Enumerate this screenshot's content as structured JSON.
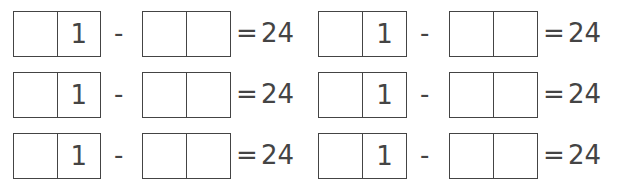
{
  "problems": [
    {
      "left_digits": [
        "",
        "1"
      ],
      "operator": "-",
      "right_digits": [
        "",
        ""
      ],
      "equals": "=",
      "result": "24"
    },
    {
      "left_digits": [
        "",
        "1"
      ],
      "operator": "-",
      "right_digits": [
        "",
        ""
      ],
      "equals": "=",
      "result": "24"
    },
    {
      "left_digits": [
        "",
        "1"
      ],
      "operator": "-",
      "right_digits": [
        "",
        ""
      ],
      "equals": "=",
      "result": "24"
    },
    {
      "left_digits": [
        "",
        "1"
      ],
      "operator": "-",
      "right_digits": [
        "",
        ""
      ],
      "equals": "=",
      "result": "24"
    },
    {
      "left_digits": [
        "",
        "1"
      ],
      "operator": "-",
      "right_digits": [
        "",
        ""
      ],
      "equals": "=",
      "result": "24"
    },
    {
      "left_digits": [
        "",
        "1"
      ],
      "operator": "-",
      "right_digits": [
        "",
        ""
      ],
      "equals": "=",
      "result": "24"
    }
  ]
}
